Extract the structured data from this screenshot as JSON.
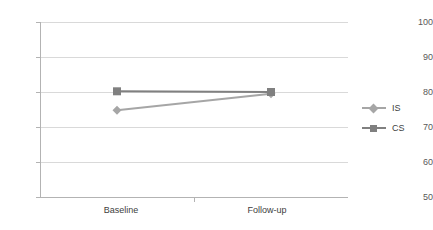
{
  "chart_data": {
    "type": "line",
    "title": "",
    "subtitle": "",
    "xlabel": "",
    "ylabel": "",
    "categories": [
      "Baseline",
      "Follow-up"
    ],
    "ylim": [
      50,
      100
    ],
    "yticks": [
      50,
      60,
      70,
      80,
      90,
      100
    ],
    "ytick_labels": [
      "50",
      "60",
      "70",
      "80",
      "90",
      "100"
    ],
    "grid": true,
    "legend_position": "right",
    "series": [
      {
        "name": "IS",
        "values": [
          74.8,
          79.5
        ],
        "color": "#a6a6a6",
        "marker": "diamond"
      },
      {
        "name": "CS",
        "values": [
          80.2,
          80.0
        ],
        "color": "#808080",
        "marker": "square"
      }
    ]
  },
  "axes": {
    "y_tick_labels": [
      "100",
      "90",
      "80",
      "70",
      "60",
      "50"
    ],
    "x_tick_labels": [
      "Baseline",
      "Follow-up"
    ]
  },
  "legend": {
    "entries": [
      {
        "label": "IS"
      },
      {
        "label": "CS"
      }
    ]
  },
  "colors": {
    "series_is": "#a6a6a6",
    "series_cs": "#808080",
    "gridline": "#d9d9d9",
    "axis": "#b3b3b3",
    "tick_text": "#595959",
    "label_text": "#404040",
    "background": "#ffffff"
  }
}
